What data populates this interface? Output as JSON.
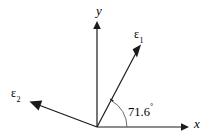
{
  "figure": {
    "background_color": "#ffffff",
    "stroke_color": "#1a1a1a",
    "width": 206,
    "height": 140
  },
  "axes": {
    "x": {
      "label": "x",
      "origin": [
        97,
        127
      ],
      "tip": [
        188,
        127
      ],
      "direction": "right",
      "arrowhead": true
    },
    "y": {
      "label": "y",
      "origin": [
        97,
        127
      ],
      "tip": [
        97,
        22
      ],
      "direction": "up",
      "arrowhead": true
    }
  },
  "vectors": [
    {
      "id": "epsilon-1",
      "symbol": "ε",
      "subscript": "1",
      "label": "ε₁",
      "origin": [
        97,
        127
      ],
      "tip": [
        141,
        44
      ],
      "angle_from_x_axis_deg": 62.1,
      "arrowhead": true
    },
    {
      "id": "epsilon-2",
      "symbol": "ε",
      "subscript": "2",
      "label": "ε₂",
      "origin": [
        97,
        127
      ],
      "tip": [
        29,
        101
      ],
      "angle_from_x_axis_deg": 159.0,
      "arrowhead": true
    }
  ],
  "angle_arc": {
    "value": "71.6",
    "degree_symbol": "°",
    "label": "71.6°",
    "vertex": [
      97,
      127
    ],
    "radius": 30,
    "from": "x-axis",
    "to": "epsilon-1"
  }
}
